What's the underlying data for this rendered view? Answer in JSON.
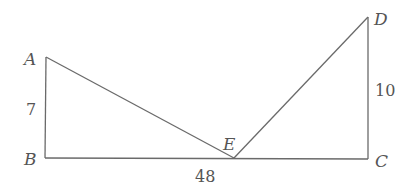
{
  "diagram": {
    "points": {
      "A": {
        "label": "A",
        "x": 46,
        "y": 57
      },
      "B": {
        "label": "B",
        "x": 45,
        "y": 158
      },
      "E": {
        "label": "E",
        "x": 234,
        "y": 158
      },
      "C": {
        "label": "C",
        "x": 368,
        "y": 159
      },
      "D": {
        "label": "D",
        "x": 368,
        "y": 17
      }
    },
    "segments": [
      {
        "from": "A",
        "to": "B"
      },
      {
        "from": "B",
        "to": "C"
      },
      {
        "from": "A",
        "to": "E"
      },
      {
        "from": "E",
        "to": "D"
      },
      {
        "from": "D",
        "to": "C"
      }
    ],
    "measurements": {
      "AB": "7",
      "BC": "48",
      "DC": "10"
    },
    "line_color": "#6a6a6a",
    "text_color": "#555555"
  }
}
